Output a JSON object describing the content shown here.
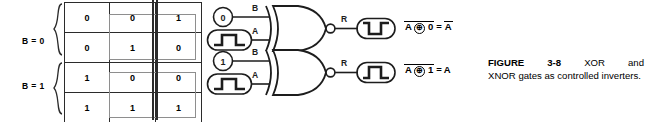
{
  "figure": {
    "number": "3-8",
    "label_prefix": "FIGURE",
    "caption_word_1": "FIGURE",
    "caption_word_2": "3-8",
    "caption_word_3": "XOR",
    "caption_word_4": "and",
    "caption_rest": "XNOR gates as controlled inverters.",
    "caption_full": "FIGURE 3-8 XOR and XNOR gates as controlled inverters."
  },
  "truth_table": {
    "columns": [
      "B",
      "A",
      "R"
    ],
    "rows": [
      {
        "B": "0",
        "A": "0",
        "R": "1"
      },
      {
        "B": "0",
        "A": "1",
        "R": "0"
      },
      {
        "B": "1",
        "A": "0",
        "R": "0"
      },
      {
        "B": "1",
        "A": "1",
        "R": "1"
      }
    ],
    "group_labels": {
      "top": "B = 0",
      "bottom": "B = 1"
    },
    "highlight_note": "grey box around A and R columns for each B group"
  },
  "circuits": [
    {
      "id": "xnor-b0",
      "gate_type": "XNOR",
      "b_input_value": "0",
      "b_input_label": "B",
      "a_input_label": "A",
      "a_input_waveform": "pulse-high",
      "output_label": "R",
      "output_waveform": "pulse-low",
      "equation": {
        "term_a": "A",
        "operator": "⊕",
        "term_b": "0",
        "equals": "=",
        "result": "A",
        "left_overbar": true,
        "result_overbar": true,
        "text": "A ⊕ 0 = A"
      }
    },
    {
      "id": "xnor-b1",
      "gate_type": "XNOR",
      "b_input_value": "1",
      "b_input_label": "B",
      "a_input_label": "A",
      "a_input_waveform": "pulse-high",
      "output_label": "R",
      "output_waveform": "pulse-high",
      "equation": {
        "term_a": "A",
        "operator": "⊕",
        "term_b": "1",
        "equals": "=",
        "result": "A",
        "left_overbar": true,
        "result_overbar": false,
        "text": "A ⊕ 1 = A"
      }
    }
  ],
  "colors": {
    "ink": "#1d1d1d",
    "rule": "#2b2b2b",
    "highlight_border": "#8e8e8e",
    "background": "#ffffff"
  }
}
